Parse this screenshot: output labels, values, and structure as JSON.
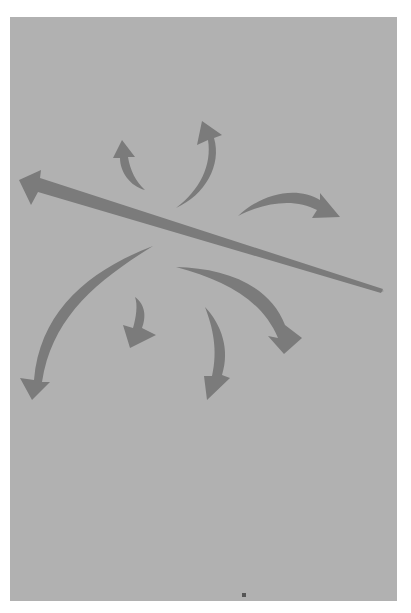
{
  "figure": {
    "colors": {
      "page": "#ffffff",
      "panel": "#b1b1b1",
      "arrow": "#7b7b7b",
      "dot": "#555555"
    },
    "arrows": [
      {
        "name": "long-diagonal-arrow",
        "direction": "left"
      },
      {
        "name": "small-up-arrow",
        "direction": "up"
      },
      {
        "name": "curved-up-arrow",
        "direction": "up"
      },
      {
        "name": "curved-right-arrow",
        "direction": "right-down"
      },
      {
        "name": "long-curved-down-left-arrow",
        "direction": "down"
      },
      {
        "name": "small-down-arrow",
        "direction": "down"
      },
      {
        "name": "curved-down-arrow",
        "direction": "down"
      },
      {
        "name": "curved-down-right-arrow",
        "direction": "down-right"
      }
    ]
  }
}
